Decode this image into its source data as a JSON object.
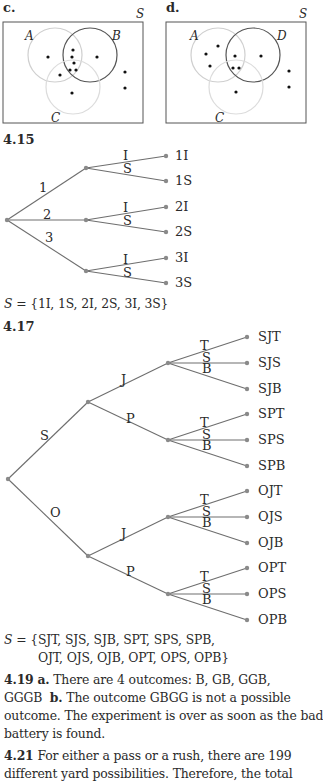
{
  "venn_c": {
    "label": "c.",
    "universe": "S",
    "sets": [
      "A",
      "B",
      "C"
    ],
    "highlighted_sets": [
      "B"
    ]
  },
  "venn_d": {
    "label": "d.",
    "universe": "S",
    "sets": [
      "A",
      "D",
      "C"
    ],
    "highlighted_sets": [
      "D"
    ]
  },
  "problem_4_15": {
    "number": "4.15",
    "first_branches": [
      "1",
      "2",
      "3"
    ],
    "second_branches": [
      "I",
      "S"
    ],
    "outcomes": [
      "1I",
      "1S",
      "2I",
      "2S",
      "3I",
      "3S"
    ],
    "sample_space_lhs": "S",
    "sample_space_rhs": "= {1I, 1S, 2I, 2S, 3I, 3S}"
  },
  "problem_4_17": {
    "number": "4.17",
    "first_branches": [
      "S",
      "O"
    ],
    "second_branches": [
      "J",
      "P"
    ],
    "third_branches": [
      "T",
      "S",
      "B"
    ],
    "outcomes": [
      "SJT",
      "SJS",
      "SJB",
      "SPT",
      "SPS",
      "SPB",
      "OJT",
      "OJS",
      "OJB",
      "OPT",
      "OPS",
      "OPB"
    ],
    "sample_space_lhs": "S",
    "sample_space_line1": "= {SJT, SJS, SJB, SPT, SPS, SPB,",
    "sample_space_line2": "OJT, OJS, OJB, OPT, OPS, OPB}"
  },
  "problem_4_19": {
    "number": "4.19",
    "part_a_label": "a.",
    "part_a_text": "There are 4 outcomes: B, GB, GGB,",
    "part_a_cont": "GGGB",
    "part_b_label": "b.",
    "part_b_text": "The outcome GBGG is not a possible",
    "line3": "outcome. The experiment is over as soon as the bad",
    "line4": "battery is found."
  },
  "problem_4_21": {
    "number": "4.21",
    "line1": "For either a pass or a rush, there are 199",
    "line2": "different yard possibilities. Therefore, the total"
  },
  "colors": {
    "text": "#2a2a2a",
    "tree_line": "#6e6e6e",
    "tree_node": "#8a8a8a",
    "faint_circle": "#cfcfcf",
    "dark_circle": "#555555"
  }
}
